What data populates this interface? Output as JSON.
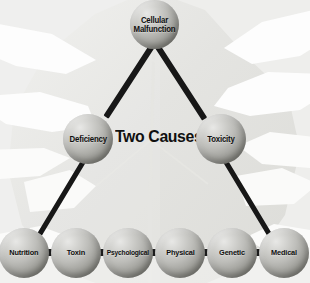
{
  "diagram": {
    "center_title": "Two Causes",
    "background": "leaf-watermark",
    "colors": {
      "connector": "#171717",
      "sphere_light": "#e8e8e6",
      "sphere_dark": "#5e5e58",
      "label_text": "#101010",
      "background": "#f2f2f0"
    },
    "nodes": {
      "root": {
        "label": "Cellular Malfunction"
      },
      "branch_left": {
        "label": "Deficiency"
      },
      "branch_right": {
        "label": "Toxicity"
      },
      "leaves": [
        {
          "label": "Nutrition"
        },
        {
          "label": "Toxin"
        },
        {
          "label": "Psychological"
        },
        {
          "label": "Physical"
        },
        {
          "label": "Genetic"
        },
        {
          "label": "Medical"
        }
      ]
    }
  }
}
